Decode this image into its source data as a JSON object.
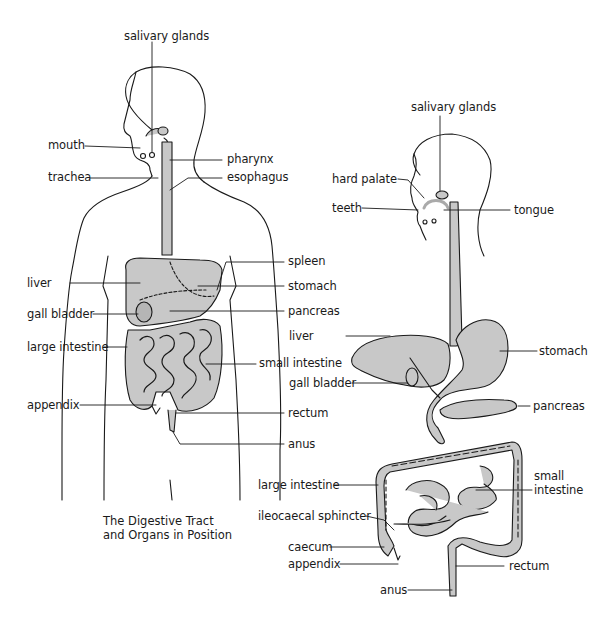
{
  "diagram": {
    "colors": {
      "line": "#1a1a1a",
      "organ_fill": "#c8c8c8",
      "background": "#ffffff"
    },
    "left_figure": {
      "caption_line1": "The Digestive Tract",
      "caption_line2": "and Organs in Position",
      "labels": {
        "salivary_glands": "salivary glands",
        "mouth": "mouth",
        "trachea": "trachea",
        "pharynx": "pharynx",
        "esophagus": "esophagus",
        "spleen": "spleen",
        "liver": "liver",
        "stomach": "stomach",
        "gall_bladder": "gall bladder",
        "pancreas": "pancreas",
        "large_intestine": "large intestine",
        "small_intestine": "small intestine",
        "appendix": "appendix",
        "rectum": "rectum",
        "anus": "anus"
      }
    },
    "right_figure": {
      "labels": {
        "salivary_glands": "salivary glands",
        "hard_palate": "hard palate",
        "teeth": "teeth",
        "tongue": "tongue",
        "liver": "liver",
        "stomach": "stomach",
        "gall_bladder": "gall bladder",
        "pancreas": "pancreas",
        "large_intestine": "large intestine",
        "small_intestine_line1": "small",
        "small_intestine_line2": "intestine",
        "ileocaecal_sphincter": "ileocaecal sphincter",
        "caecum": "caecum",
        "appendix": "appendix",
        "rectum": "rectum",
        "anus": "anus"
      }
    }
  }
}
